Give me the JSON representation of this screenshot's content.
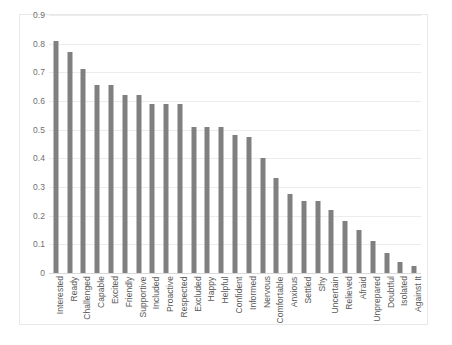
{
  "chart_data": {
    "type": "bar",
    "title": "",
    "subtitle": "",
    "xlabel": "",
    "ylabel": "",
    "ylim": [
      0,
      0.9
    ],
    "ytick_labels": [
      "0.9",
      "0.8",
      "0.7",
      "0.6",
      "0.5",
      "0.4",
      "0.3",
      "0.2",
      "0.1",
      "0"
    ],
    "ytick_values": [
      0.9,
      0.8,
      0.7,
      0.6,
      0.5,
      0.4,
      0.3,
      0.2,
      0.1,
      0
    ],
    "grid": true,
    "legend": false,
    "legend_position": "none",
    "orientation": "vertical",
    "bar_color": "#808080",
    "background_color": "#ffffff",
    "gridline_color": "#ececed",
    "border_color": "#e8e8e8",
    "categories": [
      "Interested",
      "Ready",
      "Challenged",
      "Capable",
      "Excited",
      "Friendly",
      "Supportive",
      "Included",
      "Proactive",
      "Respected",
      "Excluded",
      "Happy",
      "Helpful",
      "Confident",
      "Informed",
      "Nervous",
      "Comfortable",
      "Anxious",
      "Settled",
      "Shy",
      "Uncertain",
      "Relieved",
      "Afraid",
      "Unprepared",
      "Doubtful",
      "Isolated",
      "Against It"
    ],
    "values": [
      0.81,
      0.77,
      0.71,
      0.655,
      0.655,
      0.62,
      0.62,
      0.59,
      0.59,
      0.59,
      0.51,
      0.51,
      0.51,
      0.48,
      0.475,
      0.4,
      0.33,
      0.275,
      0.25,
      0.25,
      0.22,
      0.18,
      0.15,
      0.11,
      0.07,
      0.04,
      0.025
    ]
  }
}
